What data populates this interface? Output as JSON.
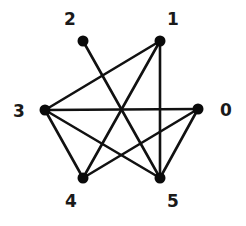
{
  "graph": {
    "colors": {
      "edge": "#111111",
      "node": "#0a0a0a",
      "label": "#1a1a1a",
      "background": "#ffffff"
    },
    "nodes": [
      {
        "id": "0",
        "label": "0",
        "x": 198,
        "y": 109,
        "label_x": 226,
        "label_y": 110
      },
      {
        "id": "1",
        "label": "1",
        "x": 160,
        "y": 41,
        "label_x": 173,
        "label_y": 19
      },
      {
        "id": "2",
        "label": "2",
        "x": 83,
        "y": 41,
        "label_x": 70,
        "label_y": 19
      },
      {
        "id": "3",
        "label": "3",
        "x": 45,
        "y": 110,
        "label_x": 19,
        "label_y": 111
      },
      {
        "id": "4",
        "label": "4",
        "x": 83,
        "y": 178,
        "label_x": 71,
        "label_y": 201
      },
      {
        "id": "5",
        "label": "5",
        "x": 160,
        "y": 178,
        "label_x": 173,
        "label_y": 201
      }
    ],
    "edges": [
      {
        "from": "2",
        "to": "5"
      },
      {
        "from": "1",
        "to": "3"
      },
      {
        "from": "1",
        "to": "4"
      },
      {
        "from": "1",
        "to": "5"
      },
      {
        "from": "3",
        "to": "0"
      },
      {
        "from": "3",
        "to": "4"
      },
      {
        "from": "3",
        "to": "5"
      },
      {
        "from": "4",
        "to": "0"
      },
      {
        "from": "0",
        "to": "5"
      }
    ]
  }
}
